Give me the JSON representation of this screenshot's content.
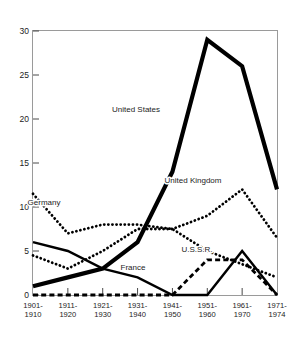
{
  "chart_data": {
    "type": "line",
    "title": "",
    "ylabel": "(Number of Prizes)",
    "xlabel": "",
    "categories": [
      "1901-\n1910",
      "1911-\n1920",
      "1921-\n1930",
      "1931-\n1940",
      "1941-\n1950",
      "1951-\n1960",
      "1961-\n1970",
      "1971-\n1974"
    ],
    "category_lines": [
      [
        "1901-",
        "1910"
      ],
      [
        "1911-",
        "1920"
      ],
      [
        "1921-",
        "1930"
      ],
      [
        "1931-",
        "1940"
      ],
      [
        "1941-",
        "1950"
      ],
      [
        "1951-",
        "1960"
      ],
      [
        "1961-",
        "1970"
      ],
      [
        "1971-",
        "1974"
      ]
    ],
    "ylim": [
      0,
      30
    ],
    "yticks": [
      0,
      5,
      10,
      15,
      20,
      25,
      30
    ],
    "ytick_labels": [
      "0",
      "5",
      "10",
      "15",
      "20",
      "25",
      "30"
    ],
    "grid": false,
    "legend_position": "inline-annotations",
    "series": [
      {
        "name": "United States",
        "style": "thick-solid",
        "color": "#000000",
        "values": [
          1,
          2,
          3,
          6,
          14,
          29,
          26,
          12
        ]
      },
      {
        "name": "Germany",
        "style": "dotted",
        "color": "#000000",
        "values": [
          11.5,
          7,
          8,
          8,
          7.5,
          5,
          3.5,
          2
        ]
      },
      {
        "name": "United Kingdom",
        "style": "dotted",
        "color": "#000000",
        "values": [
          4.5,
          3,
          5,
          7.5,
          7.5,
          9,
          12,
          6.5
        ]
      },
      {
        "name": "France",
        "style": "solid",
        "color": "#000000",
        "values": [
          6,
          5,
          3,
          2,
          0,
          0,
          5,
          0
        ]
      },
      {
        "name": "U.S.S.R.",
        "style": "dashed",
        "color": "#000000",
        "values": [
          0,
          0,
          0,
          0,
          0,
          4,
          4,
          0
        ]
      }
    ],
    "annotations": [
      {
        "text": "United States",
        "x_px": 136,
        "y_px": 112
      },
      {
        "text": "Germany",
        "x_px": 44,
        "y_px": 205
      },
      {
        "text": "United Kingdom",
        "x_px": 193,
        "y_px": 183
      },
      {
        "text": "U.S.S.R.",
        "x_px": 197,
        "y_px": 252
      },
      {
        "text": "France",
        "x_px": 133,
        "y_px": 270
      }
    ]
  }
}
